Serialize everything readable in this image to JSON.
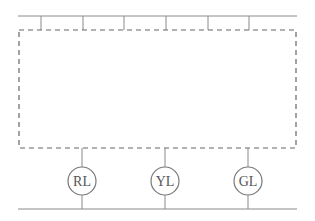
{
  "diagram": {
    "type": "circuit-schematic",
    "top_bus": {
      "y": 16,
      "x1": 18,
      "x2": 297
    },
    "top_taps_x": [
      41,
      83,
      124,
      166,
      208,
      249
    ],
    "dashed_box": {
      "x": 19,
      "y": 30,
      "w": 277,
      "h": 118
    },
    "bottom_bus": {
      "y": 209,
      "x1": 18,
      "x2": 297
    },
    "lamps": [
      {
        "label": "RL",
        "cx": 82
      },
      {
        "label": "YL",
        "cx": 165
      },
      {
        "label": "GL",
        "cx": 248
      }
    ],
    "lamp_cy": 181,
    "lamp_r": 14,
    "line_color": "#8a8a8a",
    "text_color": "#555555"
  }
}
